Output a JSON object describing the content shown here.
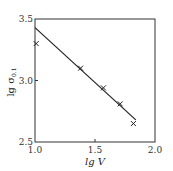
{
  "chart_data": {
    "type": "scatter",
    "title": "",
    "xlabel": "lg V",
    "ylabel": "lg σ0.1",
    "xlim": [
      1.0,
      2.0
    ],
    "ylim": [
      2.5,
      3.5
    ],
    "x_ticks": [
      "1.0",
      "1.5",
      "2.0"
    ],
    "y_ticks": [
      "2.5",
      "3.0",
      "3.5"
    ],
    "grid": false,
    "legend": null,
    "series": [
      {
        "name": "measured",
        "marker": "x",
        "points": [
          {
            "x": 1.01,
            "y": 3.3
          },
          {
            "x": 1.38,
            "y": 3.1
          },
          {
            "x": 1.57,
            "y": 2.94
          },
          {
            "x": 1.71,
            "y": 2.81
          },
          {
            "x": 1.82,
            "y": 2.65
          }
        ]
      },
      {
        "name": "fit",
        "style": "line",
        "points": [
          {
            "x": 1.0,
            "y": 3.43
          },
          {
            "x": 1.84,
            "y": 2.68
          }
        ]
      }
    ]
  },
  "axes": {
    "xlabel": "lg V",
    "ylabel_main": "lg σ",
    "ylabel_sub": "0.1",
    "x_ticks": [
      "1.0",
      "1.5",
      "2.0"
    ],
    "y_ticks": [
      "2.5",
      "3.0",
      "3.5"
    ]
  }
}
